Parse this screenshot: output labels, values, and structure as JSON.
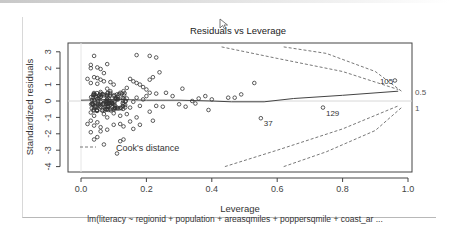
{
  "chart_data": {
    "type": "scatter",
    "title": "Residuals vs Leverage",
    "xlabel": "Leverage",
    "ylabel": "Standardized residuals",
    "subtitle": "lm(literacy ~ regionid + population + areasqmiles + poppersqmile + coast_ar ...",
    "xlim": [
      0.0,
      1.0
    ],
    "ylim": [
      -4,
      3
    ],
    "x_ticks": [
      "0.0",
      "0.2",
      "0.4",
      "0.6",
      "0.8",
      "1.0"
    ],
    "y_ticks": [
      "3",
      "2",
      "1",
      "0",
      "-1",
      "-2",
      "-3",
      "-4"
    ],
    "right_labels": [
      {
        "text": "0.5",
        "y": 0.55
      },
      {
        "text": "1",
        "y": -0.4
      }
    ],
    "legend": {
      "label": "Cook's distance",
      "style": "dashed",
      "position": "bottom-left"
    },
    "grid": false,
    "labeled_points": [
      {
        "id": "105",
        "x": 0.96,
        "y": 1.25
      },
      {
        "id": "37",
        "x": 0.55,
        "y": -1.05
      },
      {
        "id": "129",
        "x": 0.74,
        "y": -0.4
      }
    ],
    "points": [
      [
        0.04,
        2.75
      ],
      [
        0.17,
        2.8
      ],
      [
        0.21,
        2.75
      ],
      [
        0.23,
        2.65
      ],
      [
        0.03,
        2.2
      ],
      [
        0.08,
        2.25
      ],
      [
        0.03,
        2.0
      ],
      [
        0.05,
        2.05
      ],
      [
        0.06,
        1.95
      ],
      [
        0.07,
        1.7
      ],
      [
        0.02,
        1.35
      ],
      [
        0.04,
        1.45
      ],
      [
        0.05,
        1.4
      ],
      [
        0.06,
        1.3
      ],
      [
        0.03,
        1.1
      ],
      [
        0.05,
        1.05
      ],
      [
        0.07,
        1.2
      ],
      [
        0.09,
        1.15
      ],
      [
        0.1,
        1.0
      ],
      [
        0.15,
        1.35
      ],
      [
        0.16,
        1.2
      ],
      [
        0.17,
        1.1
      ],
      [
        0.18,
        1.0
      ],
      [
        0.19,
        0.85
      ],
      [
        0.21,
        1.3
      ],
      [
        0.22,
        1.45
      ],
      [
        0.24,
        1.75
      ],
      [
        0.2,
        0.7
      ],
      [
        0.21,
        0.5
      ],
      [
        0.2,
        0.3
      ],
      [
        0.23,
        0.45
      ],
      [
        0.26,
        0.5
      ],
      [
        0.28,
        0.3
      ],
      [
        0.31,
        0.75
      ],
      [
        0.36,
        0.15
      ],
      [
        0.38,
        0.3
      ],
      [
        0.4,
        0.1
      ],
      [
        0.45,
        0.2
      ],
      [
        0.47,
        0.2
      ],
      [
        0.49,
        0.4
      ],
      [
        0.53,
        1.1
      ],
      [
        0.39,
        -0.55
      ],
      [
        0.23,
        -0.3
      ],
      [
        0.25,
        -0.35
      ],
      [
        0.3,
        -0.2
      ],
      [
        0.32,
        -0.35
      ],
      [
        0.34,
        0.0
      ],
      [
        0.35,
        -0.15
      ],
      [
        0.18,
        -0.3
      ],
      [
        0.21,
        -0.65
      ],
      [
        0.02,
        -1.4
      ],
      [
        0.03,
        -1.2
      ],
      [
        0.04,
        -1.5
      ],
      [
        0.05,
        -1.3
      ],
      [
        0.06,
        -1.6
      ],
      [
        0.03,
        -1.9
      ],
      [
        0.05,
        -2.2
      ],
      [
        0.04,
        -2.35
      ],
      [
        0.07,
        -2.65
      ],
      [
        0.11,
        -3.2
      ],
      [
        0.06,
        -1.85
      ],
      [
        0.08,
        -1.75
      ],
      [
        0.1,
        -1.45
      ],
      [
        0.12,
        -1.4
      ],
      [
        0.13,
        -1.55
      ],
      [
        0.15,
        -1.25
      ],
      [
        0.16,
        -1.7
      ],
      [
        0.18,
        -1.45
      ],
      [
        0.17,
        -1.0
      ],
      [
        0.22,
        -1.2
      ],
      [
        0.13,
        -2.35
      ],
      [
        0.12,
        -2.45
      ],
      [
        0.03,
        -0.7
      ],
      [
        0.04,
        -0.9
      ],
      [
        0.05,
        -0.6
      ],
      [
        0.07,
        -0.8
      ],
      [
        0.08,
        -1.0
      ],
      [
        0.1,
        -0.75
      ],
      [
        0.12,
        -0.9
      ],
      [
        0.14,
        -0.8
      ],
      [
        0.13,
        -0.2
      ],
      [
        0.15,
        -0.4
      ],
      [
        0.12,
        0.5
      ],
      [
        0.13,
        0.6
      ],
      [
        0.14,
        0.8
      ],
      [
        0.11,
        0.4
      ],
      [
        0.09,
        0.6
      ],
      [
        0.08,
        0.75
      ],
      [
        0.06,
        0.55
      ],
      [
        0.07,
        0.35
      ],
      [
        0.17,
        0.2
      ],
      [
        0.19,
        0.1
      ],
      [
        0.16,
        -0.05
      ],
      [
        0.14,
        0.15
      ],
      [
        0.05,
        -0.15
      ],
      [
        0.06,
        -0.35
      ],
      [
        0.09,
        -0.5
      ],
      [
        0.11,
        -0.4
      ],
      [
        0.04,
        0.05
      ],
      [
        0.08,
        0.1
      ]
    ],
    "dense_cluster": {
      "x_range": [
        0.03,
        0.14
      ],
      "y_range": [
        -0.6,
        0.5
      ],
      "count_estimate": 120
    },
    "smooth_line": [
      [
        0.0,
        0.05
      ],
      [
        0.1,
        0.1
      ],
      [
        0.2,
        0.05
      ],
      [
        0.3,
        0.05
      ],
      [
        0.4,
        0.0
      ],
      [
        0.46,
        -0.05
      ],
      [
        0.56,
        -0.05
      ],
      [
        0.65,
        0.15
      ],
      [
        0.8,
        0.35
      ],
      [
        0.97,
        0.6
      ]
    ],
    "cooks_contours": {
      "upper_0.5": [
        [
          0.43,
          3.3
        ],
        [
          0.6,
          2.6
        ],
        [
          0.8,
          1.8
        ],
        [
          0.97,
          0.7
        ]
      ],
      "upper_1": [
        [
          0.62,
          3.3
        ],
        [
          0.75,
          2.9
        ],
        [
          0.9,
          1.8
        ],
        [
          0.98,
          0.6
        ]
      ],
      "lower_0.5": [
        [
          0.44,
          -4.0
        ],
        [
          0.6,
          -3.0
        ],
        [
          0.8,
          -1.7
        ],
        [
          0.97,
          -0.3
        ]
      ],
      "lower_1": [
        [
          0.62,
          -4.0
        ],
        [
          0.75,
          -3.1
        ],
        [
          0.9,
          -1.8
        ],
        [
          0.98,
          -0.4
        ]
      ]
    }
  }
}
